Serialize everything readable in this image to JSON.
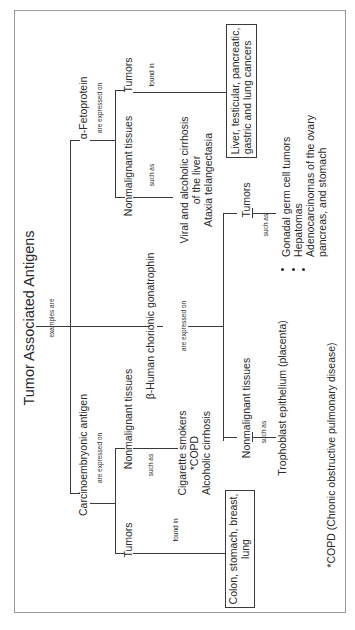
{
  "title": "Tumor Associated Antigens",
  "root_link": "examples are",
  "antigens": [
    {
      "name": "α-Fetoprotein",
      "link": "are expressed on",
      "branches": {
        "tumors": {
          "label": "Tumors",
          "link": "found in",
          "box_lines": [
            "Liver, testicular, pancreatic,",
            "gastric and lung cancers"
          ]
        },
        "nonmalignant": {
          "label": "Nonmalignant tissues",
          "link": "such as",
          "items": [
            "Viral and alcoholic cirrhosis",
            "of the liver",
            "Ataxia telangectasia"
          ]
        }
      }
    },
    {
      "name": "β-Human chorionic gonatrophin",
      "link": "are expressed on",
      "branches": {
        "tumors": {
          "label": "Tumors",
          "link": "such as",
          "items": [
            "Gonadal germ cell tumors",
            "Hepatomas",
            "Adenocarcinomas of the ovary",
            "pancreas, and stomach"
          ]
        },
        "nonmalignant": {
          "label": "Nonmalignant tissues",
          "link": "such as",
          "items": [
            "Trophoblast epithelium (placenta)"
          ]
        }
      }
    },
    {
      "name": "Carcinoembryonic antigen",
      "link": "are expressed on",
      "branches": {
        "tumors": {
          "label": "Tumors",
          "link": "found in",
          "box_lines": [
            "Colon, stomach, breast,",
            "lung"
          ]
        },
        "nonmalignant": {
          "label": "Nonmalignant tissues",
          "link": "such as",
          "items": [
            "Cigarette smokers",
            "*COPD",
            "Alcoholic cirrhosis"
          ]
        }
      }
    }
  ],
  "footnote": "*COPD (Chronic obstructive pulmonary disease)"
}
